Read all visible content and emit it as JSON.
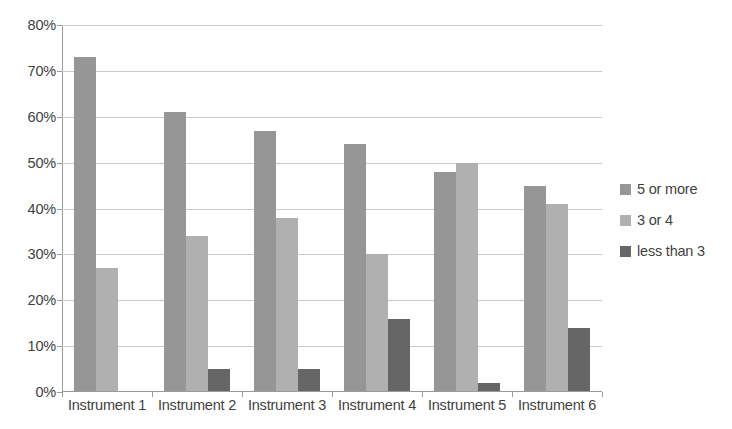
{
  "chart_data": {
    "type": "bar",
    "title": "",
    "subtitle": "",
    "xlabel": "",
    "ylabel": "",
    "categories": [
      "Instrument 1",
      "Instrument 2",
      "Instrument 3",
      "Instrument 4",
      "Instrument 5",
      "Instrument 6"
    ],
    "series": [
      {
        "name": "5 or more",
        "color": "#969696",
        "values": [
          73,
          61,
          57,
          54,
          48,
          45
        ]
      },
      {
        "name": "3 or 4",
        "color": "#b0b0b0",
        "values": [
          27,
          34,
          38,
          30,
          50,
          41
        ]
      },
      {
        "name": "less than 3",
        "color": "#666666",
        "values": [
          0,
          5,
          5,
          16,
          2,
          14
        ]
      }
    ],
    "ylim": [
      0,
      80
    ],
    "ytick_values": [
      0,
      10,
      20,
      30,
      40,
      50,
      60,
      70,
      80
    ],
    "ytick_labels": [
      "0%",
      "10%",
      "20%",
      "30%",
      "40%",
      "50%",
      "60%",
      "70%",
      "80%"
    ],
    "grid": true,
    "grid_axis": "y",
    "legend_position": "right",
    "value_suffix": "%"
  },
  "colors": {
    "series_5_or_more": "#969696",
    "series_3_or_4": "#b0b0b0",
    "series_less_than_3": "#666666",
    "gridline": "#c9c9c9",
    "axis": "#9a9a9a",
    "text": "#3f3f3f",
    "background": "#ffffff"
  }
}
